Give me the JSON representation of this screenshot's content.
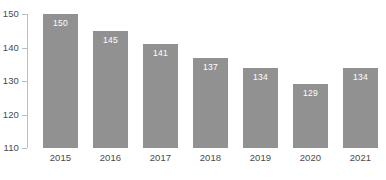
{
  "chart_data": {
    "type": "bar",
    "title": "",
    "subtitle": "",
    "xlabel": "",
    "ylabel": "",
    "categories": [
      "2015",
      "2016",
      "2017",
      "2018",
      "2019",
      "2020",
      "2021"
    ],
    "values": [
      150,
      145,
      141,
      137,
      134,
      129,
      134
    ],
    "data_labels": [
      "150",
      "145",
      "141",
      "137",
      "134",
      "129",
      "134"
    ],
    "ylim": [
      110,
      150
    ],
    "yticks": [
      110,
      120,
      130,
      140,
      150
    ],
    "ytick_labels": [
      "110",
      "120",
      "130",
      "140",
      "150"
    ],
    "grid": false,
    "legend": false,
    "legend_position": "none",
    "annotations": [],
    "colors": {
      "bar": "#919191",
      "bar_label_text": "#ffffff",
      "axis_text": "#4a4a4a",
      "axis_line": "#bdbdbd",
      "background": "#ffffff"
    }
  }
}
